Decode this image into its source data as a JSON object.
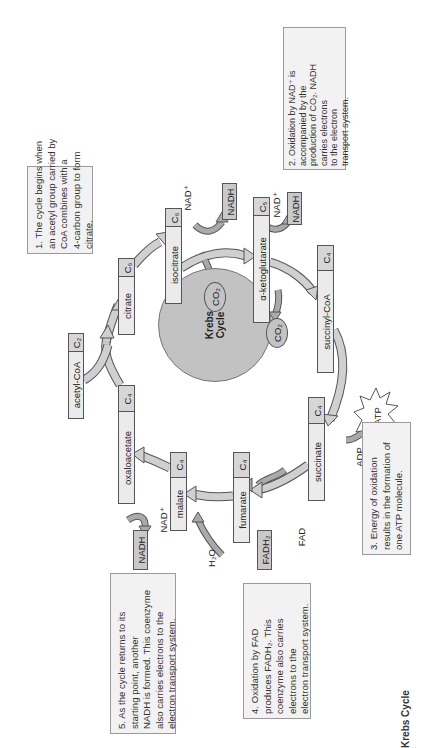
{
  "figure": {
    "title": "Krebs Cycle",
    "center_label_line1": "Krebs",
    "center_label_line2": "Cycle",
    "orientation": "rotated 90° counter-clockwise"
  },
  "colors": {
    "molecule_fill": "#ebebeb",
    "carbon_fill": "#d6d6d6",
    "product_fill": "#c9c9c9",
    "circle_fill": "#c2c2c2",
    "arrow_fill": "#d0d0d0",
    "arrow_stroke": "#555555",
    "note_fill": "#f2f2f2"
  },
  "notes": [
    {
      "id": "1",
      "lines": [
        "1. The cycle begins when",
        "an acetyl group carried by",
        "CoA combines with a",
        "4-carbon group to form",
        "citrate."
      ]
    },
    {
      "id": "2",
      "lines": [
        "2. Oxidation by NAD⁺ is",
        "accompanied by the",
        "production of CO₂. NADH",
        "carries electrons",
        "to the electron",
        "transport system."
      ]
    },
    {
      "id": "3",
      "lines": [
        "3. Energy of oxidation",
        "results in the formation of",
        "one ATP molecule."
      ]
    },
    {
      "id": "4",
      "lines": [
        "4. Oxidation by FAD",
        "produces FADH₂. This",
        "coenzyme also carries",
        "electrons to the",
        "electron transport system."
      ]
    },
    {
      "id": "5",
      "lines": [
        "5.  As the cycle returns to its",
        "starting point, another",
        "NADH is formed. This coenzyme",
        "also carries electrons to the",
        "electron transport system."
      ]
    }
  ],
  "molecules": [
    {
      "name": "acetyl-CoA",
      "carbons": "C₂"
    },
    {
      "name": "citrate",
      "carbons": "C₆"
    },
    {
      "name": "isocitrate",
      "carbons": "C₆"
    },
    {
      "name": "α-ketoglutarate",
      "carbons": "C₅"
    },
    {
      "name": "succinyl-CoA",
      "carbons": "C₄"
    },
    {
      "name": "succinate",
      "carbons": "C₄"
    },
    {
      "name": "fumarate",
      "carbons": "C₄"
    },
    {
      "name": "malate",
      "carbons": "C₄"
    },
    {
      "name": "oxaloacetate",
      "carbons": "C₄"
    }
  ],
  "products": {
    "nadh_1": "NADH",
    "nadh_2": "NADH",
    "nadh_3": "NADH",
    "fadh2": "FADH₂",
    "atp": "ATP",
    "co2_1": "CO₂",
    "co2_2": "CO₂"
  },
  "reactants": {
    "nad_1": "NAD⁺",
    "nad_2": "NAD⁺",
    "nad_3": "NAD⁺",
    "fad": "FAD",
    "adp": "ADP",
    "h2o": "H₂O"
  }
}
